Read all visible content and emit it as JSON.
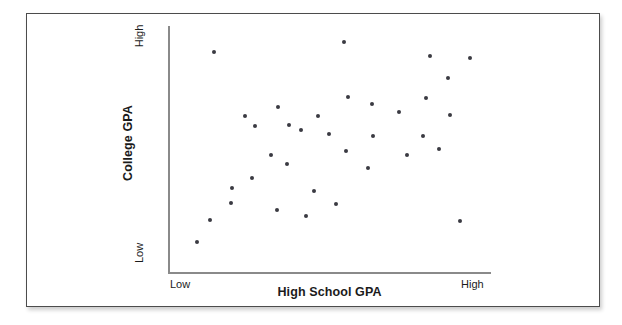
{
  "figure": {
    "background_color": "#ffffff",
    "frame_color": "#4c4c4c",
    "axis_color": "#8a8a8a",
    "point_color": "#3a3a42"
  },
  "chart_data": {
    "type": "scatter",
    "title": "",
    "subtitle": "",
    "xlabel": "High School GPA",
    "ylabel": "College GPA",
    "xtick_labels": [
      "Low",
      "High"
    ],
    "ytick_labels": [
      "Low",
      "High"
    ],
    "xlim": [
      0,
      100
    ],
    "ylim": [
      0,
      100
    ],
    "grid": false,
    "legend": false,
    "legend_position": "none",
    "annotations": [],
    "relationship": "positive",
    "n_points": 35,
    "series": [
      {
        "name": "students",
        "marker": "filled-circle",
        "color": "#3a3a42",
        "points": [
          {
            "x": 13.6,
            "y": 91.0
          },
          {
            "x": 54.5,
            "y": 95.0
          },
          {
            "x": 33.8,
            "y": 67.8
          },
          {
            "x": 23.5,
            "y": 64.1
          },
          {
            "x": 46.1,
            "y": 64.1
          },
          {
            "x": 37.2,
            "y": 60.5
          },
          {
            "x": 81.1,
            "y": 89.0
          },
          {
            "x": 93.9,
            "y": 88.2
          },
          {
            "x": 87.0,
            "y": 80.0
          },
          {
            "x": 79.9,
            "y": 71.5
          },
          {
            "x": 63.0,
            "y": 69.0
          },
          {
            "x": 71.5,
            "y": 66.0
          },
          {
            "x": 87.5,
            "y": 64.5
          },
          {
            "x": 55.7,
            "y": 71.9
          },
          {
            "x": 26.5,
            "y": 60.0
          },
          {
            "x": 41.0,
            "y": 58.5
          },
          {
            "x": 49.6,
            "y": 56.5
          },
          {
            "x": 63.5,
            "y": 56.0
          },
          {
            "x": 79.0,
            "y": 56.0
          },
          {
            "x": 84.0,
            "y": 50.5
          },
          {
            "x": 55.0,
            "y": 49.5
          },
          {
            "x": 74.0,
            "y": 48.0
          },
          {
            "x": 31.5,
            "y": 48.0
          },
          {
            "x": 36.5,
            "y": 44.0
          },
          {
            "x": 62.0,
            "y": 42.5
          },
          {
            "x": 25.5,
            "y": 38.5
          },
          {
            "x": 19.5,
            "y": 34.0
          },
          {
            "x": 45.0,
            "y": 33.0
          },
          {
            "x": 19.0,
            "y": 28.0
          },
          {
            "x": 52.0,
            "y": 27.5
          },
          {
            "x": 33.5,
            "y": 25.0
          },
          {
            "x": 42.5,
            "y": 22.5
          },
          {
            "x": 12.5,
            "y": 21.0
          },
          {
            "x": 90.5,
            "y": 20.5
          },
          {
            "x": 8.5,
            "y": 11.5
          }
        ]
      }
    ]
  }
}
